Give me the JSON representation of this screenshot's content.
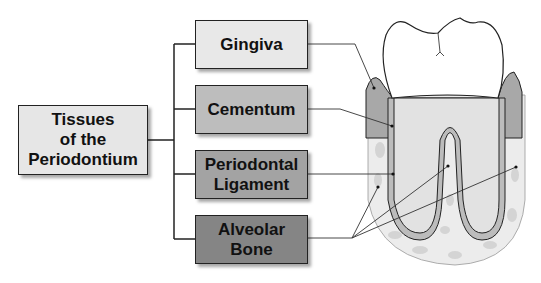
{
  "diagram": {
    "root": {
      "label_lines": [
        "Tissues",
        "of the",
        "Periodontium"
      ],
      "color": "#e6e6e6"
    },
    "branches": [
      {
        "label_lines": [
          "Gingiva"
        ],
        "color": "#e8e8e8"
      },
      {
        "label_lines": [
          "Cementum"
        ],
        "color": "#bdbdbd"
      },
      {
        "label_lines": [
          "Periodontal",
          "Ligament"
        ],
        "color": "#a3a3a3"
      },
      {
        "label_lines": [
          "Alveolar",
          "Bone"
        ],
        "color": "#858585"
      }
    ],
    "illustration": "Cross-section of a molar tooth showing gingiva, cementum, periodontal ligament and alveolar bone"
  }
}
